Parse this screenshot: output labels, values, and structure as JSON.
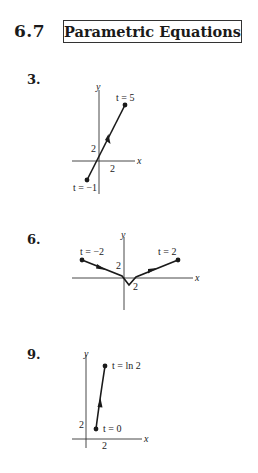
{
  "header": {
    "section_number": "6.7",
    "section_title": "Parametric Equations"
  },
  "problems": [
    {
      "number": "3.",
      "graph": {
        "axis_labels": {
          "x": "x",
          "y": "y"
        },
        "tick_labels": {
          "x": "2",
          "y": "2"
        },
        "start_label": "t = −1",
        "end_label": "t = 5",
        "start_var": "t",
        "start_val": " = −1",
        "end_var": "t",
        "end_val": " = 5",
        "description": "Line segment with arrow pointing from t=-1 to t=5"
      }
    },
    {
      "number": "6.",
      "graph": {
        "axis_labels": {
          "x": "x",
          "y": "y"
        },
        "tick_labels": {
          "x": "2",
          "y": "2"
        },
        "start_label": "t = −2",
        "end_label": "t = 2",
        "start_var": "t",
        "start_val": " = −2",
        "end_var": "t",
        "end_val": " = 2",
        "description": "V-shaped path from t=-2 down to vertex then up to t=2"
      }
    },
    {
      "number": "9.",
      "graph": {
        "axis_labels": {
          "x": "x",
          "y": "y"
        },
        "tick_labels": {
          "x": "2",
          "y": "2"
        },
        "start_label": "t = 0",
        "end_label": "t = ln 2",
        "start_var": "t",
        "start_val": " = 0",
        "end_var": "t",
        "end_val": " = ln 2",
        "description": "Steep curve from t=0 up to t=ln 2"
      }
    }
  ]
}
